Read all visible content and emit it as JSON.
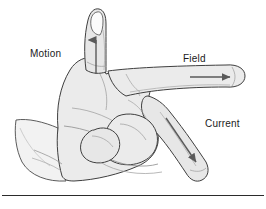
{
  "figure": {
    "background_color": "#ffffff",
    "outline_color": "#3a3a3a",
    "skin_fill": "#ebebeb",
    "skin_shade": "#dcdcdc",
    "arrow_color": "#5a5a5a",
    "text_color": "#1a1a1a",
    "rule_color": "#2b2b2b"
  },
  "labels": {
    "motion": "Motion",
    "field": "Field",
    "current": "Current"
  },
  "arrows": [
    {
      "name": "motion-arrow",
      "label": "Motion",
      "direction": "up",
      "on": "thumb"
    },
    {
      "name": "field-arrow",
      "label": "Field",
      "direction": "right",
      "on": "index-finger"
    },
    {
      "name": "current-arrow",
      "label": "Current",
      "direction": "down-right",
      "on": "middle-finger"
    }
  ],
  "icons": {
    "motion_arrow": "arrow-up-icon",
    "field_arrow": "arrow-right-icon",
    "current_arrow": "arrow-down-right-icon"
  }
}
